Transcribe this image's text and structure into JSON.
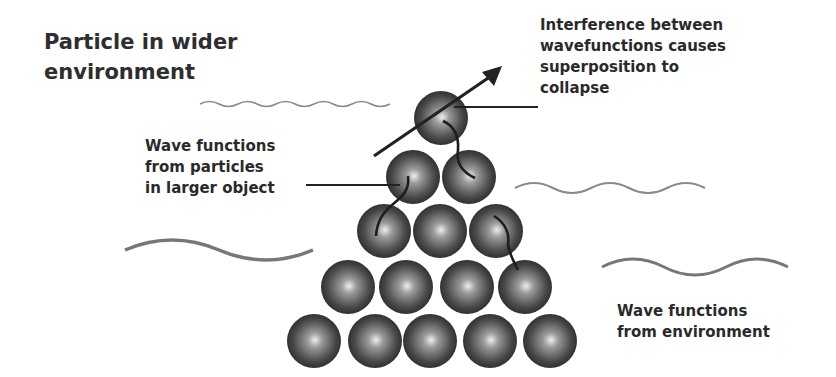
{
  "title": "Particle in wider\nenvironment",
  "labels": {
    "interference": "Interference between\nwavefunctions causes\nsuperposition to\ncollapse",
    "particles": "Wave functions\nfrom particles\nin larger object",
    "environment": "Wave functions\nfrom environment"
  },
  "colors": {
    "text": "#2a2a2a",
    "ball_dark": "#2b2b2b",
    "ball_light": "#e8e8e8",
    "wave": "#7a7a7a",
    "arrow": "#222222"
  },
  "pyramid": {
    "radius": 27,
    "rows": [
      [
        [
          441,
          118
        ]
      ],
      [
        [
          413,
          177
        ],
        [
          469,
          177
        ]
      ],
      [
        [
          384,
          231
        ],
        [
          440,
          231
        ],
        [
          496,
          231
        ]
      ],
      [
        [
          348,
          287
        ],
        [
          406,
          287
        ],
        [
          467,
          287
        ],
        [
          525,
          287
        ]
      ],
      [
        [
          314,
          341
        ],
        [
          375,
          341
        ],
        [
          430,
          341
        ],
        [
          490,
          341
        ],
        [
          550,
          341
        ]
      ]
    ]
  }
}
